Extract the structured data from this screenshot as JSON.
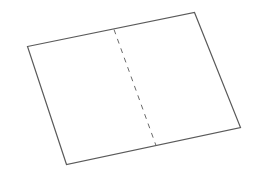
{
  "diagram": {
    "shape": "sheet",
    "fold_line_style": "dashed",
    "colors": {
      "outline": "#5a5a5a",
      "fold": "#6a6a6a",
      "background": "#ffffff"
    }
  }
}
